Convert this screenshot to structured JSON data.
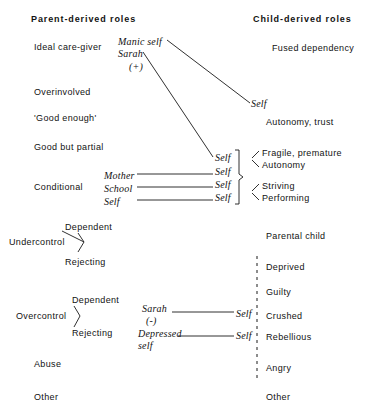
{
  "figure": {
    "type": "reciprocal-role-diagram",
    "headers": {
      "left": "Parent-derived roles",
      "right": "Child-derived roles"
    },
    "parent_roles": [
      "Ideal care-giver",
      "Overinvolved",
      "'Good enough'",
      "Good but partial",
      "Conditional",
      "Undercontrol",
      "Overcontrol",
      "Abuse",
      "Other"
    ],
    "child_roles": [
      "Fused dependency",
      "Autonomy, trust",
      "Fragile, premature",
      "Autonomy",
      "Striving",
      "Performing",
      "Parental child",
      "Deprived",
      "Guilty",
      "Crushed",
      "Rebellious",
      "Angry",
      "Other"
    ],
    "undercontrol_branches": [
      "Dependent",
      "Rejecting"
    ],
    "overcontrol_branches": [
      "Dependent",
      "Rejecting"
    ],
    "annotations": {
      "manic_self": "Manic self",
      "sarah_positive_name": "Sarah",
      "sarah_positive_sign": "(+)",
      "sarah_negative_name": "Sarah",
      "sarah_negative_sign": "(-)",
      "depressed_self_line1": "Depressed",
      "depressed_self_line2": "self",
      "conditional_sources": [
        "Mother",
        "School",
        "Self"
      ],
      "self_label": "Self"
    },
    "self_markers": {
      "top_diagonal": "Self",
      "brace_row_1": "Self",
      "brace_row_2": "Self",
      "brace_row_3": "Self",
      "brace_row_4": "Self",
      "sarah_negative_target": "Self",
      "depressed_self_target": "Self"
    },
    "colors": {
      "ink": "#1a1a1a",
      "background": "#ffffff"
    }
  }
}
